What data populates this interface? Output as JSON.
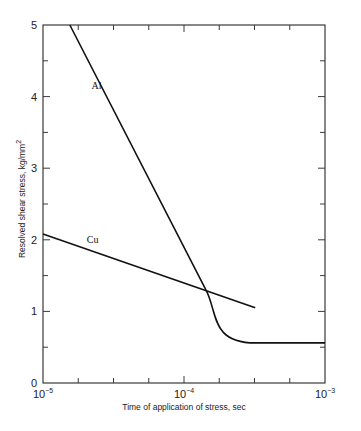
{
  "chart_data": {
    "type": "line",
    "title": "",
    "xlabel": "Time of application of stress, sec",
    "ylabel": "Resolved shear stress, kg/mm",
    "ylabel_superscript": "2",
    "x_scale": "log",
    "xlim": [
      1e-05,
      0.001
    ],
    "ylim": [
      0,
      5
    ],
    "grid": false,
    "legend": "inline labels",
    "x_ticks": [
      {
        "value": 1e-05,
        "base": "10",
        "exp": "−5"
      },
      {
        "value": 0.0001,
        "base": "10",
        "exp": "−4"
      },
      {
        "value": 0.001,
        "base": "10",
        "exp": "−3"
      }
    ],
    "y_ticks": [
      "0",
      "1",
      "2",
      "3",
      "4",
      "5"
    ],
    "series": [
      {
        "name": "Al",
        "label": "Al",
        "points": [
          {
            "x": 1.55e-05,
            "y": 5.0
          },
          {
            "x": 0.000143,
            "y": 1.3
          },
          {
            "x": 0.000165,
            "y": 1.09
          },
          {
            "x": 0.000195,
            "y": 0.88
          },
          {
            "x": 0.00025,
            "y": 0.67
          },
          {
            "x": 0.00032,
            "y": 0.56
          },
          {
            "x": 0.001,
            "y": 0.56
          }
        ]
      },
      {
        "name": "Cu",
        "label": "Cu",
        "points": [
          {
            "x": 1e-05,
            "y": 2.08
          },
          {
            "x": 0.00032,
            "y": 1.05
          }
        ]
      }
    ],
    "annotations": [
      {
        "text": "Al",
        "near": {
          "x": 2.4e-05,
          "y": 4.1
        }
      },
      {
        "text": "Cu",
        "near": {
          "x": 2.25e-05,
          "y": 1.95
        }
      }
    ]
  }
}
